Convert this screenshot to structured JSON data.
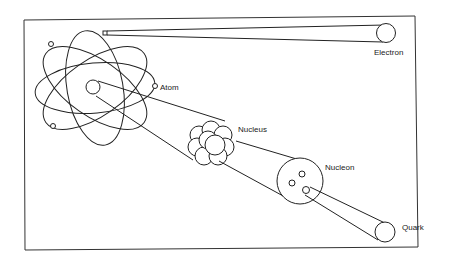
{
  "diagram": {
    "labels": {
      "electron": "Electron",
      "atom": "Atom",
      "nucleus": "Nucleus",
      "nucleon": "Nucleon",
      "quark": "Quark"
    },
    "colors": {
      "line": "#222222",
      "background": "#ffffff",
      "frame": "#333333"
    }
  }
}
